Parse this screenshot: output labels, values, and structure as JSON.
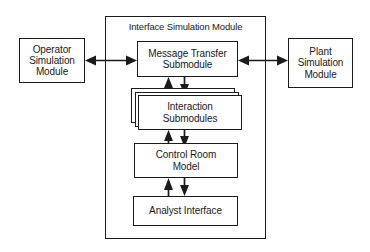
{
  "diagram": {
    "title": "Interface Simulation Module",
    "container": {
      "label": "Interface Simulation Module"
    },
    "nodes": {
      "operator": "Operator\nSimulation\nModule",
      "plant": "Plant\nSimulation\nModule",
      "message_transfer": "Message Transfer\nSubmodule",
      "interaction": "Interaction\nSubmodules",
      "control_room": "Control Room\nModel",
      "analyst": "Analyst Interface"
    },
    "connections": [
      {
        "name": "operator-to-message",
        "type": "bidirectional",
        "orientation": "horizontal"
      },
      {
        "name": "message-to-plant",
        "type": "bidirectional",
        "orientation": "horizontal"
      },
      {
        "name": "message-to-interaction",
        "type": "bidirectional",
        "orientation": "vertical"
      },
      {
        "name": "interaction-to-control-room",
        "type": "bidirectional",
        "orientation": "vertical"
      },
      {
        "name": "control-room-to-analyst",
        "type": "bidirectional",
        "orientation": "vertical"
      }
    ],
    "colors": {
      "stroke": "#1b1b1b",
      "fill": "#ffffff",
      "background": "#ffffff"
    }
  }
}
